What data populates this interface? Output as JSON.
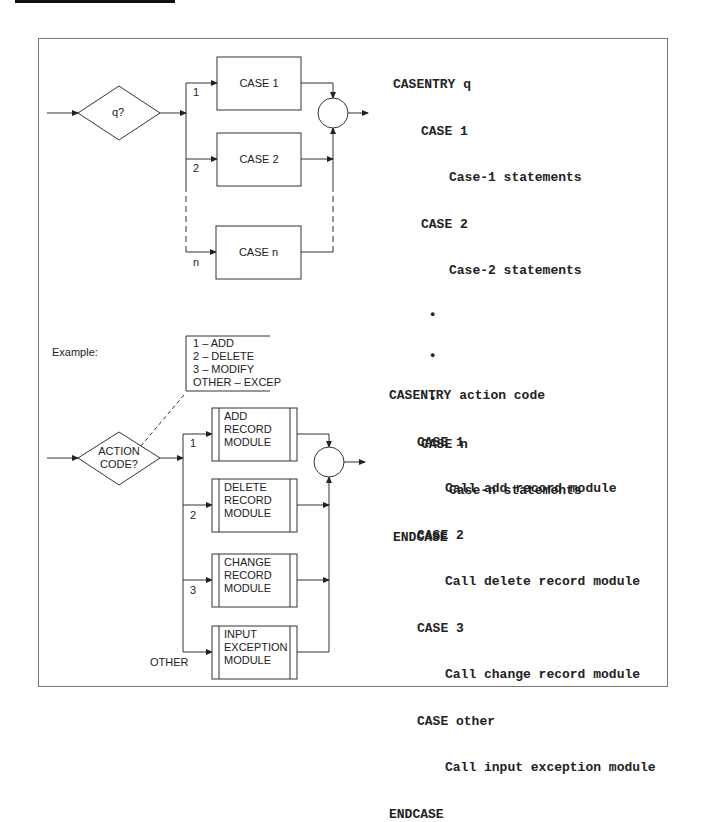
{
  "top_diagram": {
    "decision_label": "q?",
    "cases": [
      {
        "branch": "1",
        "label": "CASE 1"
      },
      {
        "branch": "2",
        "label": "CASE 2"
      },
      {
        "branch": "n",
        "label": "CASE n"
      }
    ],
    "pseudocode": [
      {
        "indent": 0,
        "text": "CASENTRY q"
      },
      {
        "indent": 1,
        "text": "CASE 1"
      },
      {
        "indent": 2,
        "text": "Case-1 statements"
      },
      {
        "indent": 1,
        "text": "CASE 2"
      },
      {
        "indent": 2,
        "text": "Case-2 statements"
      },
      {
        "indent": 1,
        "text": " •"
      },
      {
        "indent": 1,
        "text": " •"
      },
      {
        "indent": 1,
        "text": " •"
      },
      {
        "indent": 1,
        "text": "CASE n"
      },
      {
        "indent": 2,
        "text": "Case-n statements"
      },
      {
        "indent": 0,
        "text": "ENDCASE"
      }
    ]
  },
  "bottom_diagram": {
    "example_label": "Example:",
    "decision_label_line1": "ACTION",
    "decision_label_line2": "CODE?",
    "annotation": [
      "1 – ADD",
      "2 – DELETE",
      "3 – MODIFY",
      "OTHER – EXCEP"
    ],
    "modules": [
      {
        "branch": "1",
        "lines": [
          "ADD",
          "RECORD",
          "MODULE"
        ]
      },
      {
        "branch": "2",
        "lines": [
          "DELETE",
          "RECORD",
          "MODULE"
        ]
      },
      {
        "branch": "3",
        "lines": [
          "CHANGE",
          "RECORD",
          "MODULE"
        ]
      },
      {
        "branch": "OTHER",
        "lines": [
          "INPUT",
          "EXCEPTION",
          "MODULE"
        ]
      }
    ],
    "pseudocode": [
      {
        "indent": 0,
        "text": "CASENTRY action code"
      },
      {
        "indent": 1,
        "text": "CASE 1"
      },
      {
        "indent": 2,
        "text": "Call add record module"
      },
      {
        "indent": 1,
        "text": "CASE 2"
      },
      {
        "indent": 2,
        "text": "Call delete record module"
      },
      {
        "indent": 1,
        "text": "CASE 3"
      },
      {
        "indent": 2,
        "text": "Call change record module"
      },
      {
        "indent": 1,
        "text": "CASE other"
      },
      {
        "indent": 2,
        "text": "Call input exception module"
      },
      {
        "indent": 0,
        "text": "ENDCASE"
      }
    ]
  }
}
